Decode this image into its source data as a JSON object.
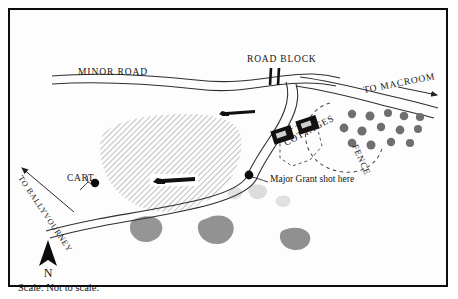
{
  "map": {
    "title": "Ambush site sketch map",
    "frame": {
      "stroke": "#0d0d0d",
      "background": "#fdfdfd"
    },
    "scale_note": "Scale: Not to scale.",
    "compass": {
      "letter": "N",
      "name": "north-arrow"
    },
    "labels": {
      "minor_road": "MINOR ROAD",
      "road_block": "ROAD BLOCK",
      "to_macroom": "TO MACROOM",
      "to_ballyvourney": "TO BALLYVOURNEY",
      "cottages": "COTTAGES",
      "fence": "FENCE",
      "cart": "CART",
      "major_grant": "Major Grant shot here"
    },
    "colors": {
      "ink": "#151515",
      "road_line": "#333333",
      "hatch": "#b5b5b5",
      "blob_fill": "#8f8f8f",
      "blob_light": "#d8d8d8",
      "building_fill": "#101010",
      "tree_fill": "#6e6e6e",
      "fence_dash": "#5a5a5a"
    },
    "features": {
      "buildings_count": 2,
      "rifle_symbols_count": 2,
      "tree_count": 14,
      "blob_count": 6,
      "marker_dots": 2
    }
  }
}
